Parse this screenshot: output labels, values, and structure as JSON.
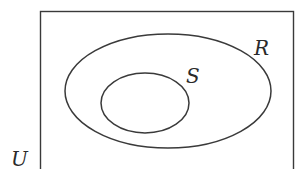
{
  "diagram": {
    "type": "venn",
    "stroke_color": "#3a3a3a",
    "sets": [
      {
        "id": "U",
        "label": "U",
        "shape": "rectangle",
        "x": 40,
        "y": 11,
        "width": 254,
        "height": 165,
        "label_x": 11,
        "label_y": 166
      },
      {
        "id": "R",
        "label": "R",
        "shape": "ellipse",
        "cx": 168,
        "cy": 91,
        "rx": 103,
        "ry": 57,
        "label_x": 254,
        "label_y": 55
      },
      {
        "id": "S",
        "label": "S",
        "shape": "ellipse",
        "cx": 145,
        "cy": 103,
        "rx": 44,
        "ry": 30,
        "label_x": 186,
        "label_y": 83
      }
    ],
    "relationship": "S ⊂ R ⊂ U"
  }
}
